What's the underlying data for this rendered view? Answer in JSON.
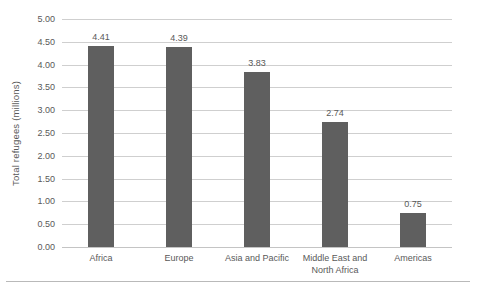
{
  "chart_data": {
    "type": "bar",
    "title": "",
    "xlabel": "",
    "ylabel": "Total refugees (millions)",
    "categories": [
      "Africa",
      "Europe",
      "Asia and Pacific",
      "Middle East and\nNorth Africa",
      "Americas"
    ],
    "category_lines": [
      [
        "Africa"
      ],
      [
        "Europe"
      ],
      [
        "Asia and Pacific"
      ],
      [
        "Middle East and",
        "North Africa"
      ],
      [
        "Americas"
      ]
    ],
    "values": [
      4.41,
      4.39,
      3.83,
      2.74,
      0.75
    ],
    "value_labels": [
      "4.41",
      "4.39",
      "3.83",
      "2.74",
      "0.75"
    ],
    "ylim": [
      0.0,
      5.0
    ],
    "ytick_step": 0.5,
    "ytick_labels": [
      "5.00",
      "4.50",
      "4.00",
      "3.50",
      "3.00",
      "2.50",
      "2.00",
      "1.50",
      "1.00",
      "0.50",
      "0.00"
    ],
    "ytick_values": [
      5.0,
      4.5,
      4.0,
      3.5,
      3.0,
      2.5,
      2.0,
      1.5,
      1.0,
      0.5,
      0.0
    ],
    "grid": true,
    "grid_axis": "y",
    "legend": false,
    "legend_position": "none",
    "orientation": "vertical",
    "colors": {
      "bar": "#5f5f5f",
      "gridline": "#cfcfcf",
      "baseline": "#c4c4c4",
      "text": "#595959",
      "background": "#ffffff",
      "bottom_rule": "#b9b9b9"
    }
  }
}
